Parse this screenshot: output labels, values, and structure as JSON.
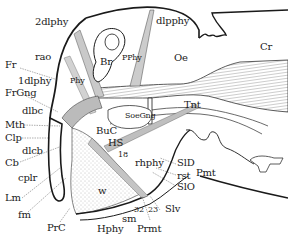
{
  "diagram": {
    "colors": {
      "ink": "#1a1a1a",
      "muscle_fill": "#bdbdbd",
      "stipple": "#cfcfcf",
      "background": "#ffffff"
    },
    "labels": [
      {
        "id": "2dlphy",
        "text": "2dlphy",
        "x": 35,
        "y": 22
      },
      {
        "id": "dlpphy",
        "text": "dlpphy",
        "x": 156,
        "y": 20
      },
      {
        "id": "rao",
        "text": "rao",
        "x": 35,
        "y": 55
      },
      {
        "id": "Fr",
        "text": "Fr",
        "x": 5,
        "y": 63
      },
      {
        "id": "Br",
        "text": "Br",
        "x": 100,
        "y": 60
      },
      {
        "id": "PPhy",
        "text": "PPhy",
        "x": 122,
        "y": 54
      },
      {
        "id": "Oe",
        "text": "Oe",
        "x": 174,
        "y": 55
      },
      {
        "id": "Cr",
        "text": "Cr",
        "x": 260,
        "y": 44
      },
      {
        "id": "1dlphy",
        "text": "1dlphy",
        "x": 18,
        "y": 77
      },
      {
        "id": "Phy",
        "text": "Phy",
        "x": 70,
        "y": 77
      },
      {
        "id": "FrGng",
        "text": "FrGng",
        "x": 5,
        "y": 90
      },
      {
        "id": "Tnt",
        "text": "Tnt",
        "x": 184,
        "y": 102
      },
      {
        "id": "dlbc",
        "text": "dlbc",
        "x": 22,
        "y": 107
      },
      {
        "id": "SoeGng",
        "text": "SoeGng",
        "x": 127,
        "y": 113
      },
      {
        "id": "Mth",
        "text": "Mth",
        "x": 5,
        "y": 120
      },
      {
        "id": "BuC",
        "text": "BuC",
        "x": 96,
        "y": 127
      },
      {
        "id": "Clp",
        "text": "Clp",
        "x": 5,
        "y": 133
      },
      {
        "id": "HS",
        "text": "HS",
        "x": 108,
        "y": 139
      },
      {
        "id": "dlcb",
        "text": "dlcb",
        "x": 22,
        "y": 147
      },
      {
        "id": "18",
        "text": "18",
        "x": 118,
        "y": 150
      },
      {
        "id": "Cb",
        "text": "Cb",
        "x": 5,
        "y": 158
      },
      {
        "id": "rhphy",
        "text": "rhphy",
        "x": 135,
        "y": 160
      },
      {
        "id": "SlD",
        "text": "SlD",
        "x": 177,
        "y": 160
      },
      {
        "id": "Pmt",
        "text": "Pmt",
        "x": 196,
        "y": 169
      },
      {
        "id": "rst",
        "text": "rst",
        "x": 177,
        "y": 171
      },
      {
        "id": "SlO",
        "text": "SlO",
        "x": 177,
        "y": 183
      },
      {
        "id": "cplr",
        "text": "cplr",
        "x": 18,
        "y": 174
      },
      {
        "id": "w",
        "text": "w",
        "x": 98,
        "y": 186
      },
      {
        "id": "Lm",
        "text": "Lm",
        "x": 5,
        "y": 194
      },
      {
        "id": "32",
        "text": "32",
        "x": 134,
        "y": 205
      },
      {
        "id": "23",
        "text": "23",
        "x": 148,
        "y": 205
      },
      {
        "id": "Slv",
        "text": "Slv",
        "x": 165,
        "y": 203
      },
      {
        "id": "fm",
        "text": "fm",
        "x": 18,
        "y": 210
      },
      {
        "id": "sm",
        "text": "sm",
        "x": 122,
        "y": 215
      },
      {
        "id": "PrC",
        "text": "PrC",
        "x": 47,
        "y": 223
      },
      {
        "id": "Hphy",
        "text": "Hphy",
        "x": 97,
        "y": 224
      },
      {
        "id": "Prmt",
        "text": "Prmt",
        "x": 137,
        "y": 224
      }
    ]
  }
}
